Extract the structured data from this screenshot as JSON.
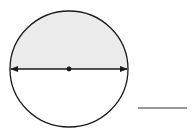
{
  "diagram": {
    "shaded_region": "upper-half",
    "colors": {
      "shade": "#ebebeb",
      "stroke": "#1a1a1a",
      "background": "#ffffff"
    },
    "answer_blank": ""
  }
}
